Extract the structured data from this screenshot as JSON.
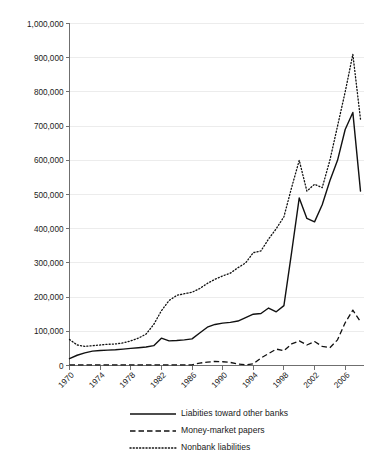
{
  "chart_data": {
    "type": "line",
    "title": "",
    "xlabel": "",
    "ylabel": "",
    "xlim": [
      1970,
      2008
    ],
    "ylim": [
      0,
      1000000
    ],
    "grid": true,
    "legend_position": "bottom",
    "ytick_labels": [
      "0",
      "100,000",
      "200,000",
      "300,000",
      "400,000",
      "500,000",
      "600,000",
      "700,000",
      "800,000",
      "900,000",
      "1,000,000"
    ],
    "ytick_values": [
      0,
      100000,
      200000,
      300000,
      400000,
      500000,
      600000,
      700000,
      800000,
      900000,
      1000000
    ],
    "xtick_labels": [
      "1970",
      "1974",
      "1978",
      "1982",
      "1986",
      "1990",
      "1994",
      "1998",
      "2002",
      "2006"
    ],
    "xtick_values": [
      1970,
      1974,
      1978,
      1982,
      1986,
      1990,
      1994,
      1998,
      2002,
      2006
    ],
    "x": [
      1970,
      1971,
      1972,
      1973,
      1974,
      1975,
      1976,
      1977,
      1978,
      1979,
      1980,
      1981,
      1982,
      1983,
      1984,
      1985,
      1986,
      1987,
      1988,
      1989,
      1990,
      1991,
      1992,
      1993,
      1994,
      1995,
      1996,
      1997,
      1998,
      1999,
      2000,
      2001,
      2002,
      2003,
      2004,
      2005,
      2006,
      2007,
      2008
    ],
    "series": [
      {
        "name": "Liabities toward other banks",
        "style": "solid",
        "values": [
          20000,
          30000,
          37000,
          42000,
          44000,
          45000,
          46000,
          48000,
          50000,
          52000,
          54000,
          58000,
          80000,
          72000,
          73000,
          75000,
          78000,
          95000,
          112000,
          120000,
          124000,
          126000,
          130000,
          140000,
          150000,
          152000,
          168000,
          157000,
          175000,
          330000,
          490000,
          430000,
          420000,
          470000,
          540000,
          600000,
          690000,
          740000,
          510000
        ]
      },
      {
        "name": "Money-market papers",
        "style": "dashed",
        "values": [
          2000,
          2000,
          2000,
          2000,
          2000,
          2000,
          2000,
          2000,
          2000,
          2000,
          2000,
          2000,
          2000,
          2000,
          2000,
          2000,
          2000,
          7000,
          10000,
          12000,
          11000,
          9000,
          4000,
          2000,
          5000,
          22000,
          35000,
          48000,
          43000,
          63000,
          72000,
          60000,
          70000,
          56000,
          52000,
          75000,
          125000,
          162000,
          128000
        ]
      },
      {
        "name": "Nonbank liabilities",
        "style": "dotted",
        "values": [
          76000,
          60000,
          56000,
          58000,
          60000,
          62000,
          63000,
          66000,
          72000,
          80000,
          92000,
          120000,
          160000,
          190000,
          205000,
          210000,
          214000,
          225000,
          240000,
          252000,
          262000,
          270000,
          286000,
          300000,
          330000,
          335000,
          370000,
          400000,
          435000,
          520000,
          600000,
          510000,
          530000,
          520000,
          600000,
          700000,
          800000,
          910000,
          720000
        ]
      }
    ],
    "legend": [
      {
        "label": "Liabities toward other banks",
        "style": "solid"
      },
      {
        "label": "Money-market papers",
        "style": "dashed"
      },
      {
        "label": "Nonbank liabilities",
        "style": "dotted"
      }
    ]
  }
}
